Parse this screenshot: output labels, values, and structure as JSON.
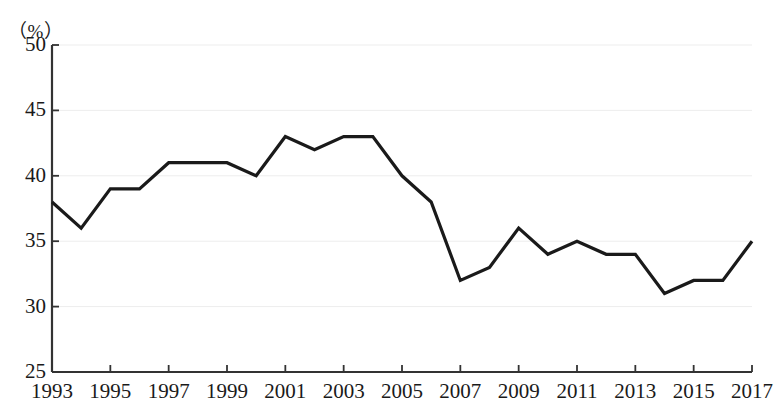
{
  "chart_data": {
    "type": "line",
    "title": "",
    "subtitle": "",
    "unit_label": "（%）",
    "xlabel": "",
    "ylabel": "",
    "ylim": [
      25,
      50
    ],
    "xlim": [
      1993,
      2017
    ],
    "y_ticks": [
      50,
      45,
      40,
      35,
      30,
      25
    ],
    "x_ticks": [
      1993,
      1995,
      1997,
      1999,
      2001,
      2003,
      2005,
      2007,
      2009,
      2011,
      2013,
      2015,
      2017
    ],
    "grid": "faint-horizontal",
    "legend": "none",
    "line_color": "#1a1a1a",
    "axis_color": "#333333",
    "x": [
      1993,
      1994,
      1995,
      1996,
      1997,
      1998,
      1999,
      2000,
      2001,
      2002,
      2003,
      2004,
      2005,
      2006,
      2007,
      2008,
      2009,
      2010,
      2011,
      2012,
      2013,
      2014,
      2015,
      2016,
      2017
    ],
    "values": [
      38,
      36,
      39,
      39,
      41,
      41,
      41,
      40,
      43,
      42,
      43,
      43,
      40,
      38,
      32,
      33,
      36,
      34,
      35,
      34,
      34,
      31,
      32,
      32,
      35
    ],
    "series": [
      {
        "name": "",
        "values": [
          38,
          36,
          39,
          39,
          41,
          41,
          41,
          40,
          43,
          42,
          43,
          43,
          40,
          38,
          32,
          33,
          36,
          34,
          35,
          34,
          34,
          31,
          32,
          32,
          35
        ]
      }
    ]
  }
}
